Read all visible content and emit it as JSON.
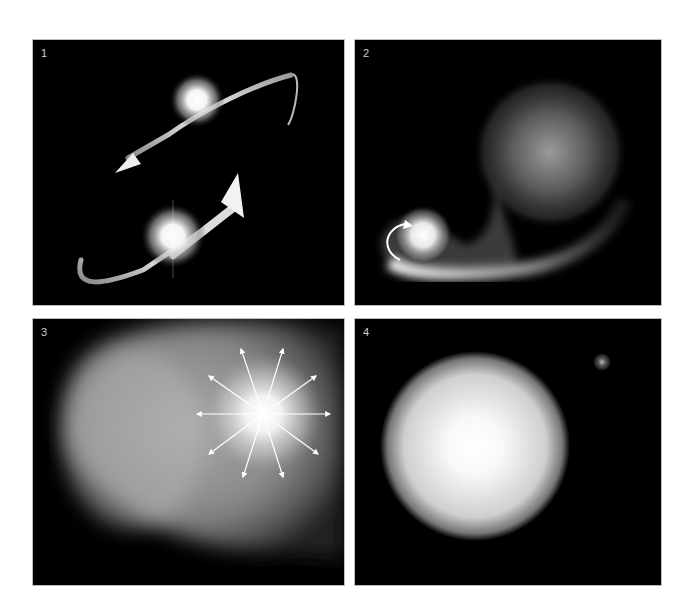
{
  "figure": {
    "panels": [
      {
        "label": "1",
        "description": "Two stars orbiting each other with curved orbital arrows"
      },
      {
        "label": "2",
        "description": "Large diffuse star transferring mass onto compact bright companion via accretion stream"
      },
      {
        "label": "3",
        "description": "Explosion with radial arrows expanding into surrounding gas cloud"
      },
      {
        "label": "4",
        "description": "Large bright glowing star with small distant remnant star"
      }
    ]
  }
}
